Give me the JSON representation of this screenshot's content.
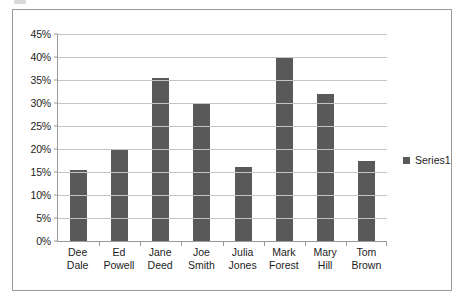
{
  "chart_data": {
    "type": "bar",
    "title": "",
    "xlabel": "",
    "ylabel": "",
    "ylim": [
      0,
      45
    ],
    "ytick_labels": [
      "45%",
      "40%",
      "35%",
      "30%",
      "25%",
      "20%",
      "15%",
      "10%",
      "5%",
      "0%"
    ],
    "ytick_values": [
      45,
      40,
      35,
      30,
      25,
      20,
      15,
      10,
      5,
      0
    ],
    "grid": true,
    "legend_position": "right",
    "categories": [
      "Dee Dale",
      "Ed Powell",
      "Jane Deed",
      "Joe Smith",
      "Julia Jones",
      "Mark Forest",
      "Mary Hill",
      "Tom Brown"
    ],
    "category_lines": [
      [
        "Dee",
        "Dale"
      ],
      [
        "Ed",
        "Powell"
      ],
      [
        "Jane",
        "Deed"
      ],
      [
        "Joe",
        "Smith"
      ],
      [
        "Julia",
        "Jones"
      ],
      [
        "Mark",
        "Forest"
      ],
      [
        "Mary",
        "Hill"
      ],
      [
        "Tom",
        "Brown"
      ]
    ],
    "series": [
      {
        "name": "Series1",
        "color": "#595959",
        "values": [
          15.5,
          20,
          35.5,
          30,
          16,
          40,
          32,
          17.5
        ]
      }
    ]
  },
  "legend": {
    "items": [
      {
        "label": "Series1",
        "color": "#595959"
      }
    ]
  },
  "style": {
    "bar_color": "#595959",
    "gridline_color": "#c4c4c4",
    "axis_color": "#9a9a9a",
    "border_color": "#9a9a9a",
    "text_color": "#1d1d1d",
    "background": "#ffffff"
  }
}
